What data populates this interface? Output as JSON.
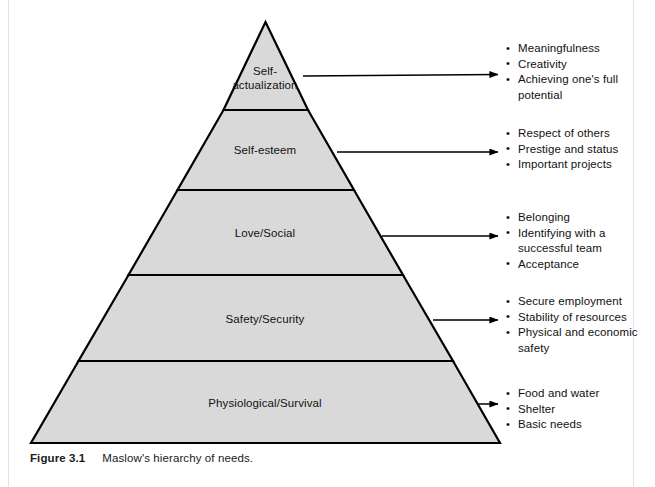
{
  "figure": {
    "caption_number": "Figure 3.1",
    "caption_text": "Maslow's hierarchy of needs.",
    "colors": {
      "tier_fill": "#d9d9d9",
      "outline": "#000000",
      "text": "#111111",
      "page_background": "#ffffff"
    }
  },
  "diagram": {
    "type": "pyramid",
    "tier_count": 5,
    "tiers": [
      {
        "index": 1,
        "position": "top",
        "label": "Self-\nactualization",
        "label_line1": "Self-",
        "label_line2": "actualization",
        "bullets": [
          "Meaningfulness",
          "Creativity",
          "Achieving one's full potential"
        ]
      },
      {
        "index": 2,
        "position": "second",
        "label": "Self-esteem",
        "bullets": [
          "Respect of others",
          "Prestige and status",
          "Important projects"
        ]
      },
      {
        "index": 3,
        "position": "middle",
        "label": "Love/Social",
        "bullets": [
          "Belonging",
          "Identifying with a successful team",
          "Acceptance"
        ]
      },
      {
        "index": 4,
        "position": "fourth",
        "label": "Safety/Security",
        "bullets": [
          "Secure employment",
          "Stability of resources",
          "Physical and economic safety"
        ]
      },
      {
        "index": 5,
        "position": "base",
        "label": "Physiological/Survival",
        "bullets": [
          "Food and water",
          "Shelter",
          "Basic needs"
        ]
      }
    ],
    "connectors": {
      "style": "arrow",
      "direction": "left-to-right",
      "count": 5
    }
  }
}
